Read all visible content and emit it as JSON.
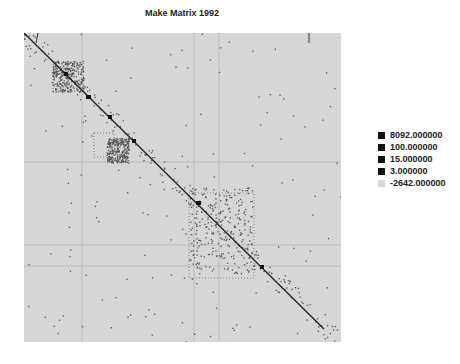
{
  "chart_data": {
    "type": "heatmap",
    "title": "Make Matrix 1992",
    "xlabel": "",
    "ylabel": "",
    "grid": false,
    "legend_position": "right",
    "legend": [
      {
        "label": "8092.000000",
        "color": "#111111"
      },
      {
        "label": "100.000000",
        "color": "#111111"
      },
      {
        "label": "15.000000",
        "color": "#111111"
      },
      {
        "label": "3.000000",
        "color": "#111111"
      },
      {
        "label": "-2642.000000",
        "color": "#d6d6d6"
      }
    ],
    "diagonal": {
      "from": [
        0,
        0
      ],
      "to": [
        1,
        1
      ]
    },
    "blocks": [
      {
        "x": [
          0.09,
          0.19
        ],
        "y": [
          0.09,
          0.19
        ]
      },
      {
        "x": [
          0.26,
          0.33
        ],
        "y": [
          0.34,
          0.42
        ]
      },
      {
        "x": [
          0.52,
          0.72
        ],
        "y": [
          0.5,
          0.78
        ]
      }
    ]
  },
  "page": {
    "title": "Make Matrix 1992",
    "legend_items": [
      {
        "label": "8092.000000"
      },
      {
        "label": "100.000000"
      },
      {
        "label": "15.000000"
      },
      {
        "label": "3.000000"
      },
      {
        "label": "-2642.000000"
      }
    ]
  }
}
